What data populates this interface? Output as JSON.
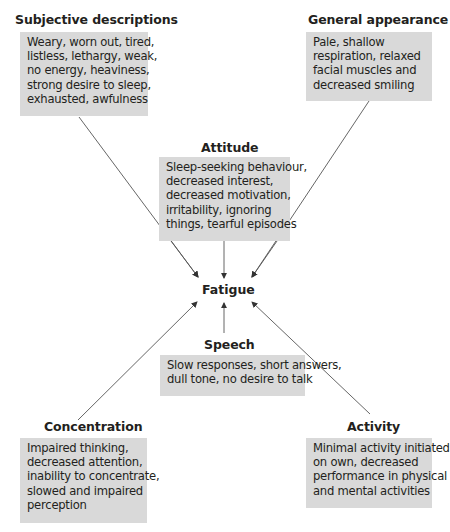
{
  "diagram": {
    "center": "Fatigue",
    "nodes": {
      "subjective": {
        "title": "Subjective descriptions",
        "lines": [
          "Weary, worn out, tired,",
          "listless, lethargy, weak,",
          "no energy, heaviness,",
          "strong desire to sleep,",
          "exhausted, awfulness"
        ]
      },
      "general": {
        "title": "General appearance",
        "lines": [
          "Pale, shallow",
          "respiration, relaxed",
          "facial muscles and",
          "decreased smiling"
        ]
      },
      "attitude": {
        "title": "Attitude",
        "lines": [
          "Sleep-seeking behaviour,",
          "decreased interest,",
          "decreased motivation,",
          "irritability, ignoring",
          "things, tearful episodes"
        ]
      },
      "speech": {
        "title": "Speech",
        "lines": [
          "Slow responses, short answers,",
          "dull tone, no desire to talk"
        ]
      },
      "concentration": {
        "title": "Concentration",
        "lines": [
          "Impaired thinking,",
          "decreased attention,",
          "inability to concentrate,",
          "slowed and impaired",
          "perception"
        ]
      },
      "activity": {
        "title": "Activity",
        "lines": [
          "Minimal activity initiated",
          "on own, decreased",
          "performance in physical",
          "and mental activities"
        ]
      }
    },
    "colors": {
      "box_fill": "#d9d9d9",
      "text": "#231f20",
      "arrow": "#444444"
    }
  }
}
